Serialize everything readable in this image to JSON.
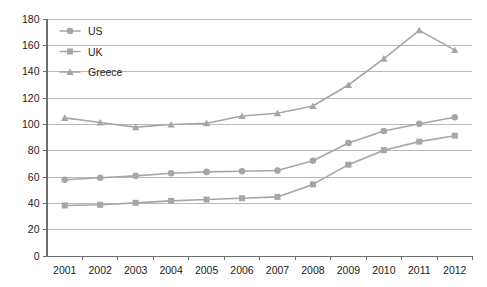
{
  "chart_data": {
    "type": "line",
    "title": "",
    "xlabel": "",
    "ylabel": "",
    "x": [
      2001,
      2002,
      2003,
      2004,
      2005,
      2006,
      2007,
      2008,
      2009,
      2010,
      2011,
      2012
    ],
    "categories": [
      "2001",
      "2002",
      "2003",
      "2004",
      "2005",
      "2006",
      "2007",
      "2008",
      "2009",
      "2010",
      "2011",
      "2012"
    ],
    "ylim": [
      0,
      180
    ],
    "ytick_step": 20,
    "yticks": [
      "0",
      "20",
      "40",
      "60",
      "80",
      "100",
      "120",
      "140",
      "160",
      "180"
    ],
    "grid": "horizontal",
    "legend_position": "top-left-inside",
    "series": [
      {
        "name": "US",
        "marker": "circle",
        "color": "#a6a6a6",
        "values": [
          57.5,
          59,
          60.5,
          62.5,
          63.5,
          64,
          64.5,
          72,
          85.5,
          94.5,
          100,
          105
        ]
      },
      {
        "name": "UK",
        "marker": "square",
        "color": "#a6a6a6",
        "values": [
          38,
          38.5,
          40,
          41.5,
          42.5,
          43.5,
          44.5,
          54,
          69,
          80,
          86.5,
          91
        ]
      },
      {
        "name": "Greece",
        "marker": "triangle",
        "color": "#a6a6a6",
        "values": [
          104.5,
          101,
          97.5,
          99.5,
          100.5,
          106,
          108,
          113.5,
          129.5,
          149.5,
          171,
          156
        ]
      }
    ]
  },
  "legend": {
    "items": [
      {
        "label": "US",
        "marker": "circle"
      },
      {
        "label": "UK",
        "marker": "square"
      },
      {
        "label": "Greece",
        "marker": "triangle"
      }
    ]
  },
  "colors": {
    "series": "#a6a6a6",
    "grid": "#b9b9b9",
    "axis": "#6e6e6e",
    "text": "#222222",
    "background": "#ffffff"
  }
}
